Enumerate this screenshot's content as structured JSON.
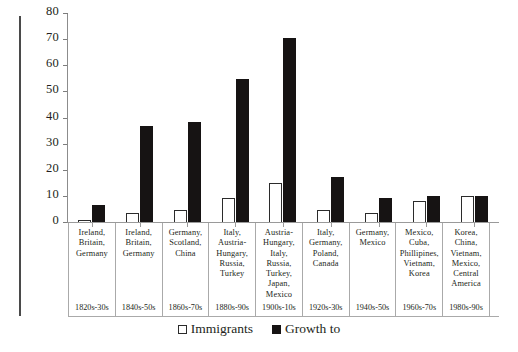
{
  "chart_data": {
    "type": "bar",
    "title": "",
    "xlabel": "",
    "ylabel": "",
    "ylim": [
      0,
      80
    ],
    "yticks": [
      0,
      10,
      20,
      30,
      40,
      50,
      60,
      70,
      80
    ],
    "grid": false,
    "legend_position": "bottom",
    "categories": [
      "Ireland,\nBritain,\nGermany",
      "Ireland,\nBritain,\nGermany",
      "Germany,\nScotland,\nChina",
      "Italy,\nAustria-\nHungary,\nRussia,\nTurkey",
      "Austria-\nHungary,\nItaly, Russia,\nTurkey,\nJapan,\nMexico",
      "Italy,\nGermany,\nPoland,\nCanada",
      "Germany,\nMexico",
      "Mexico,\nCuba,\nPhillipines,\nVietnam,\nKorea",
      "Korea,\nChina,\nVietnam,\nMexico,\nCentral\nAmerica"
    ],
    "decades": [
      "1820s-30s",
      "1840s-50s",
      "1860s-70s",
      "1880s-90s",
      "1900s-10s",
      "1920s-30s",
      "1940s-50s",
      "1960s-70s",
      "1980s-90s"
    ],
    "series": [
      {
        "name": "Immigrants",
        "color": "#ffffff",
        "values": [
          1,
          4,
          5,
          9.5,
          15.5,
          5,
          4,
          8.3,
          10.3
        ]
      },
      {
        "name": "Growth to",
        "color": "#161313",
        "values": [
          7,
          37,
          38.5,
          55,
          71,
          17.5,
          9.5,
          10.5,
          10.4
        ]
      }
    ]
  },
  "legend": {
    "items": [
      {
        "label": "Immigrants",
        "swatch": "open-square"
      },
      {
        "label": "Growth to",
        "swatch": "filled-square"
      }
    ]
  },
  "axis": {
    "ylabels": [
      "80",
      "70",
      "60",
      "50",
      "40",
      "30",
      "20",
      "10",
      "0"
    ]
  }
}
